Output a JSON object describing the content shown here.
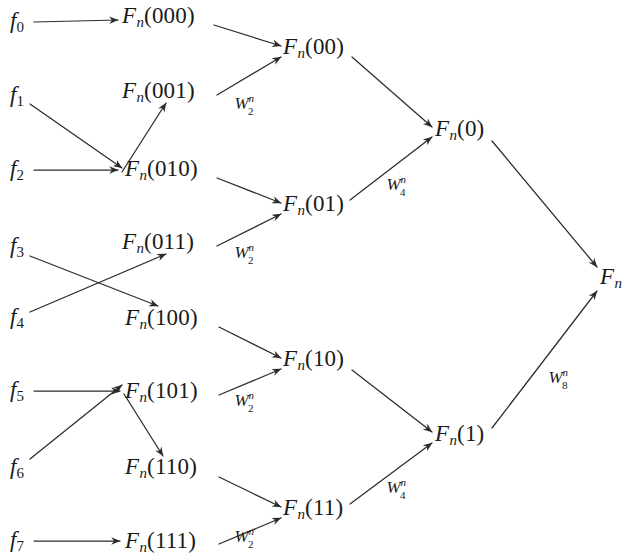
{
  "figure": {
    "type": "fft-butterfly-signal-flow-graph",
    "title": "",
    "background_color": "#ffffff",
    "line_color": "#2b2b2b",
    "text_color": "#1a1a1a",
    "width": 635,
    "height": 558
  },
  "inputs": [
    {
      "id": "f0",
      "base": "f",
      "index": "0",
      "x": 10,
      "y": 22
    },
    {
      "id": "f1",
      "base": "f",
      "index": "1",
      "x": 10,
      "y": 96
    },
    {
      "id": "f2",
      "base": "f",
      "index": "2",
      "x": 10,
      "y": 170
    },
    {
      "id": "f3",
      "base": "f",
      "index": "3",
      "x": 10,
      "y": 247
    },
    {
      "id": "f4",
      "base": "f",
      "index": "4",
      "x": 10,
      "y": 318
    },
    {
      "id": "f5",
      "base": "f",
      "index": "5",
      "x": 10,
      "y": 391
    },
    {
      "id": "f6",
      "base": "f",
      "index": "6",
      "x": 10,
      "y": 468
    },
    {
      "id": "f7",
      "base": "f",
      "index": "7",
      "x": 10,
      "y": 541
    }
  ],
  "stage1": [
    {
      "id": "s1_000",
      "base": "F",
      "sub": "n",
      "arg": "(000)",
      "x": 122,
      "y": 17
    },
    {
      "id": "s1_001",
      "base": "F",
      "sub": "n",
      "arg": "(001)",
      "x": 122,
      "y": 92
    },
    {
      "id": "s1_010",
      "base": "F",
      "sub": "n",
      "arg": "(010)",
      "x": 125,
      "y": 170
    },
    {
      "id": "s1_011",
      "base": "F",
      "sub": "n",
      "arg": "(011)",
      "x": 122,
      "y": 243
    },
    {
      "id": "s1_100",
      "base": "F",
      "sub": "n",
      "arg": "(100)",
      "x": 125,
      "y": 319
    },
    {
      "id": "s1_101",
      "base": "F",
      "sub": "n",
      "arg": "(101)",
      "x": 125,
      "y": 392
    },
    {
      "id": "s1_110",
      "base": "F",
      "sub": "n",
      "arg": "(110)",
      "x": 125,
      "y": 468
    },
    {
      "id": "s1_111",
      "base": "F",
      "sub": "n",
      "arg": "(111)",
      "x": 125,
      "y": 542
    }
  ],
  "stage2": [
    {
      "id": "s2_00",
      "base": "F",
      "sub": "n",
      "arg": "(00)",
      "x": 283,
      "y": 48
    },
    {
      "id": "s2_01",
      "base": "F",
      "sub": "n",
      "arg": "(01)",
      "x": 283,
      "y": 205
    },
    {
      "id": "s2_10",
      "base": "F",
      "sub": "n",
      "arg": "(10)",
      "x": 283,
      "y": 360
    },
    {
      "id": "s2_11",
      "base": "F",
      "sub": "n",
      "arg": "(11)",
      "x": 283,
      "y": 509
    }
  ],
  "stage3": [
    {
      "id": "s3_0",
      "base": "F",
      "sub": "n",
      "arg": "(0)",
      "x": 435,
      "y": 130
    },
    {
      "id": "s3_1",
      "base": "F",
      "sub": "n",
      "arg": "(1)",
      "x": 435,
      "y": 435
    }
  ],
  "output": {
    "id": "out",
    "base": "F",
    "sub": "n",
    "arg": "",
    "x": 600,
    "y": 278
  },
  "twiddles": [
    {
      "id": "w2_a",
      "base": "W",
      "sup": "n",
      "sub": "2",
      "x": 247,
      "y": 103
    },
    {
      "id": "w2_b",
      "base": "W",
      "sup": "n",
      "sub": "2",
      "x": 247,
      "y": 252
    },
    {
      "id": "w2_c",
      "base": "W",
      "sup": "n",
      "sub": "2",
      "x": 247,
      "y": 400
    },
    {
      "id": "w2_d",
      "base": "W",
      "sup": "n",
      "sub": "2",
      "x": 247,
      "y": 536
    },
    {
      "id": "w4_a",
      "base": "W",
      "sup": "n",
      "sub": "4",
      "x": 399,
      "y": 184
    },
    {
      "id": "w4_b",
      "base": "W",
      "sup": "n",
      "sub": "4",
      "x": 399,
      "y": 487
    },
    {
      "id": "w8_a",
      "base": "W",
      "sup": "n",
      "sub": "8",
      "x": 561,
      "y": 377
    }
  ],
  "edges": [
    {
      "id": "e_f0_000",
      "from": "f0",
      "to": "s1_000",
      "x1": 34,
      "y1": 22,
      "x2": 118,
      "y2": 20
    },
    {
      "id": "e_f1_010",
      "from": "f1",
      "to": "s1_010",
      "x1": 30,
      "y1": 104,
      "x2": 122,
      "y2": 168
    },
    {
      "id": "e_f2_001",
      "from": "f2",
      "to": "s1_001",
      "x1": 34,
      "y1": 170,
      "x2": 118,
      "y2": 170
    },
    {
      "id": "e_f2_001b",
      "from": "f2",
      "to": "s1_001",
      "x1": 122,
      "y1": 172,
      "x2": 166,
      "y2": 103
    },
    {
      "id": "e_f3_100",
      "from": "f3",
      "to": "s1_100",
      "x1": 30,
      "y1": 256,
      "x2": 158,
      "y2": 306
    },
    {
      "id": "e_f4_011",
      "from": "f4",
      "to": "s1_011",
      "x1": 30,
      "y1": 312,
      "x2": 166,
      "y2": 254
    },
    {
      "id": "e_f5_101",
      "from": "f5",
      "to": "s1_101",
      "x1": 34,
      "y1": 391,
      "x2": 120,
      "y2": 391
    },
    {
      "id": "e_f5_110",
      "from": "f5",
      "to": "s1_110",
      "x1": 124,
      "y1": 394,
      "x2": 163,
      "y2": 456
    },
    {
      "id": "e_f6_101",
      "from": "f6",
      "to": "s1_101",
      "x1": 30,
      "y1": 459,
      "x2": 122,
      "y2": 385
    },
    {
      "id": "e_f7_111",
      "from": "f7",
      "to": "s1_111",
      "x1": 34,
      "y1": 541,
      "x2": 120,
      "y2": 541
    },
    {
      "id": "e_000_00",
      "from": "s1_000",
      "to": "s2_00",
      "x1": 214,
      "y1": 25,
      "x2": 281,
      "y2": 46
    },
    {
      "id": "e_001_00",
      "from": "s1_001",
      "to": "s2_00",
      "x1": 217,
      "y1": 95,
      "x2": 281,
      "y2": 57
    },
    {
      "id": "e_010_01",
      "from": "s1_010",
      "to": "s2_01",
      "x1": 217,
      "y1": 178,
      "x2": 281,
      "y2": 203
    },
    {
      "id": "e_011_01",
      "from": "s1_011",
      "to": "s2_01",
      "x1": 217,
      "y1": 246,
      "x2": 281,
      "y2": 214
    },
    {
      "id": "e_100_10",
      "from": "s1_100",
      "to": "s2_10",
      "x1": 219,
      "y1": 327,
      "x2": 281,
      "y2": 358
    },
    {
      "id": "e_101_10",
      "from": "s1_101",
      "to": "s2_10",
      "x1": 219,
      "y1": 395,
      "x2": 281,
      "y2": 369
    },
    {
      "id": "e_110_11",
      "from": "s1_110",
      "to": "s2_11",
      "x1": 219,
      "y1": 477,
      "x2": 281,
      "y2": 507
    },
    {
      "id": "e_111_11",
      "from": "s1_111",
      "to": "s2_11",
      "x1": 219,
      "y1": 544,
      "x2": 281,
      "y2": 518
    },
    {
      "id": "e_00_0",
      "from": "s2_00",
      "to": "s3_0",
      "x1": 352,
      "y1": 57,
      "x2": 432,
      "y2": 127
    },
    {
      "id": "e_01_0",
      "from": "s2_01",
      "to": "s3_0",
      "x1": 350,
      "y1": 200,
      "x2": 432,
      "y2": 137
    },
    {
      "id": "e_10_1",
      "from": "s2_10",
      "to": "s3_1",
      "x1": 352,
      "y1": 370,
      "x2": 432,
      "y2": 432
    },
    {
      "id": "e_11_1",
      "from": "s2_11",
      "to": "s3_1",
      "x1": 350,
      "y1": 504,
      "x2": 432,
      "y2": 443
    },
    {
      "id": "e_0_out",
      "from": "s3_0",
      "to": "out",
      "x1": 492,
      "y1": 141,
      "x2": 597,
      "y2": 267
    },
    {
      "id": "e_1_out",
      "from": "s3_1",
      "to": "out",
      "x1": 492,
      "y1": 428,
      "x2": 597,
      "y2": 291
    }
  ]
}
